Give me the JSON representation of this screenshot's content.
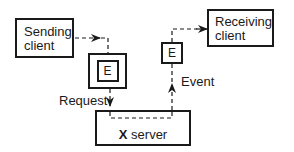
{
  "diagram": {
    "nodes": {
      "sending_client": {
        "line1": "Sending",
        "line2": "client"
      },
      "receiving_client": {
        "line1": "Receiving",
        "line2": "client"
      },
      "request_packet": {
        "label": "E"
      },
      "event_packet": {
        "label": "E"
      },
      "x_server": {
        "bold": "X",
        "rest": " server"
      }
    },
    "edges": {
      "request_label": "Request",
      "event_label": "Event"
    },
    "colors": {
      "stroke": "#1a1a1a",
      "background": "#ffffff"
    }
  }
}
